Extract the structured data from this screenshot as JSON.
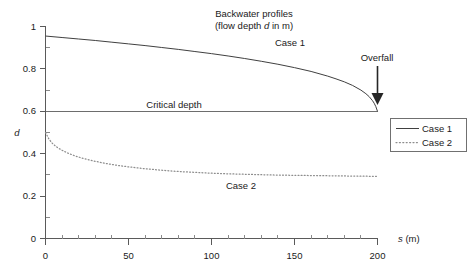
{
  "chart_data": {
    "type": "line",
    "title": "Backwater profiles",
    "subtitle": "(flow depth d in m)",
    "subtitle_italic_symbol": "d",
    "xlabel": "s (m)",
    "xlabel_symbol": "s",
    "xlabel_unit": "(m)",
    "ylabel": "d",
    "xlim": [
      0,
      200
    ],
    "ylim": [
      0,
      1
    ],
    "x_ticks": [
      0,
      50,
      100,
      150,
      200
    ],
    "x_tick_labels": [
      "0",
      "50",
      "100",
      "150",
      "200"
    ],
    "x_minor_step": 10,
    "y_ticks": [
      0,
      0.2,
      0.4,
      0.6,
      0.8,
      1
    ],
    "y_tick_labels": [
      "0",
      "0.2",
      "0.4",
      "0.6",
      "0.8",
      "1"
    ],
    "y_minor_step": 0.1,
    "grid": false,
    "legend_position": "right-outside",
    "series": [
      {
        "name": "Case 1",
        "style": "solid",
        "color": "#404040",
        "x": [
          0,
          10,
          20,
          30,
          40,
          50,
          60,
          70,
          80,
          90,
          100,
          110,
          120,
          130,
          140,
          150,
          160,
          170,
          175,
          180,
          185,
          190,
          193,
          195,
          197,
          198,
          199,
          199.5,
          200
        ],
        "values": [
          0.955,
          0.948,
          0.941,
          0.934,
          0.926,
          0.918,
          0.91,
          0.901,
          0.892,
          0.882,
          0.872,
          0.861,
          0.849,
          0.836,
          0.822,
          0.806,
          0.788,
          0.766,
          0.753,
          0.739,
          0.722,
          0.7,
          0.683,
          0.669,
          0.65,
          0.638,
          0.622,
          0.611,
          0.6
        ]
      },
      {
        "name": "Case 2",
        "style": "dotted",
        "color": "#8d8d8d",
        "x": [
          0,
          2,
          4,
          6,
          8,
          10,
          14,
          18,
          22,
          26,
          30,
          35,
          40,
          45,
          50,
          60,
          70,
          80,
          90,
          100,
          110,
          120,
          130,
          140,
          150,
          160,
          170,
          180,
          190,
          200
        ],
        "values": [
          0.5,
          0.47,
          0.45,
          0.436,
          0.425,
          0.416,
          0.401,
          0.389,
          0.379,
          0.371,
          0.364,
          0.356,
          0.349,
          0.343,
          0.338,
          0.329,
          0.322,
          0.316,
          0.312,
          0.308,
          0.305,
          0.303,
          0.301,
          0.299,
          0.298,
          0.297,
          0.296,
          0.295,
          0.294,
          0.293
        ]
      }
    ],
    "reference_lines": [
      {
        "name": "Critical depth",
        "label": "Critical depth",
        "orientation": "horizontal",
        "value": 0.6,
        "color": "#6d6d6d"
      }
    ],
    "annotations": [
      {
        "name": "case-1-label",
        "text": "Case 1",
        "x": 155,
        "y": 0.885
      },
      {
        "name": "case-2-label",
        "text": "Case 2",
        "x": 118,
        "y": 0.215
      },
      {
        "name": "critical-depth-label",
        "text": "Critical depth",
        "x": 78,
        "y": 0.645
      },
      {
        "name": "overfall-label",
        "text": "Overfall",
        "x": 198,
        "y": 0.815
      }
    ],
    "arrow": {
      "name": "overfall-arrow",
      "from": {
        "x": 200,
        "y": 0.775
      },
      "to": {
        "x": 200,
        "y": 0.625
      }
    }
  },
  "legend": {
    "items": [
      {
        "label": "Case 1",
        "style": "solid"
      },
      {
        "label": "Case 2",
        "style": "dotted"
      }
    ]
  }
}
